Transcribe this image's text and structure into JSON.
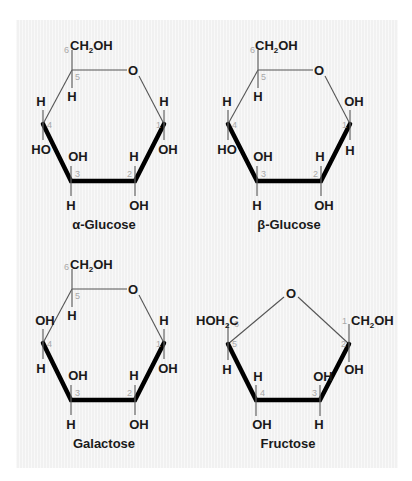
{
  "figure": {
    "molecules": [
      {
        "id": "alpha-glucose",
        "name": "α-Glucose",
        "ring_oxygen": "O",
        "carbon_numbers": [
          "1",
          "2",
          "3",
          "4",
          "5",
          "6"
        ],
        "substituents": {
          "c6": "CH2OH",
          "c5_down": "H",
          "c4_up": "H",
          "c4_down": "HO",
          "c3_up": "OH",
          "c3_down": "H",
          "c2_up": "H",
          "c2_down": "OH",
          "c1_up": "H",
          "c1_down": "OH"
        }
      },
      {
        "id": "beta-glucose",
        "name": "β-Glucose",
        "ring_oxygen": "O",
        "carbon_numbers": [
          "1",
          "2",
          "3",
          "4",
          "5",
          "6"
        ],
        "substituents": {
          "c6": "CH2OH",
          "c5_down": "H",
          "c4_up": "H",
          "c4_down": "HO",
          "c3_up": "OH",
          "c3_down": "H",
          "c2_up": "H",
          "c2_down": "OH",
          "c1_up": "OH",
          "c1_down": "H"
        }
      },
      {
        "id": "galactose",
        "name": "Galactose",
        "ring_oxygen": "O",
        "carbon_numbers": [
          "1",
          "2",
          "3",
          "4",
          "5",
          "6"
        ],
        "substituents": {
          "c6": "CH2OH",
          "c5_down": "H",
          "c4_up": "OH",
          "c4_down": "H",
          "c3_up": "OH",
          "c3_down": "H",
          "c2_up": "H",
          "c2_down": "OH",
          "c1_up": "H",
          "c1_down": "OH"
        }
      },
      {
        "id": "fructose",
        "name": "Fructose",
        "ring_oxygen": "O",
        "carbon_numbers": [
          "1",
          "2",
          "3",
          "4",
          "5",
          "6"
        ],
        "substituents": {
          "c6": "HOH2C",
          "c5_down": "H",
          "c4_up": "H",
          "c4_down": "OH",
          "c3_up": "OH",
          "c3_down": "H",
          "c1": "CH2OH",
          "c2_down": "OH"
        }
      }
    ]
  }
}
